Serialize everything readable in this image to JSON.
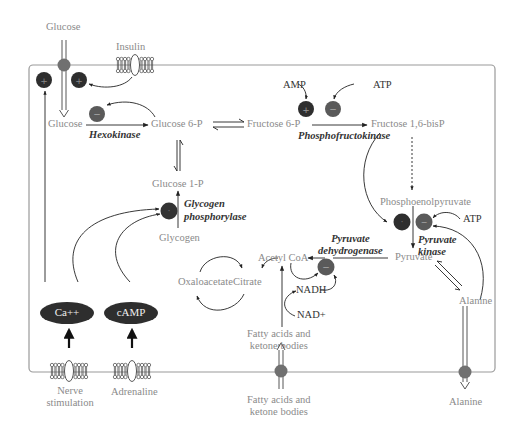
{
  "diagram": {
    "type": "metabolic-regulation-diagram",
    "colors": {
      "activator": "#3a3a3a",
      "inhibitor": "#5e5e5e",
      "transporter": "#707070",
      "line": "#333333",
      "cell_border": "#9a9a9a",
      "metabolite_text": "#8a8a8a",
      "label_text": "#333333"
    },
    "outside": {
      "glucose_top": "Glucose",
      "insulin": "Insulin",
      "nerve": "Nerve\nstimulation",
      "adrenaline": "Adrenaline",
      "fatty_bottom": "Fatty acids and\nketone bodies",
      "alanine_bottom": "Alanine"
    },
    "metabolites": {
      "glucose": "Glucose",
      "glucose6p": "Glucose 6-P",
      "fructose6p": "Fructose 6-P",
      "fructose16bp": "Fructose 1,6-bisP",
      "glucose1p": "Glucose 1-P",
      "glycogen": "Glycogen",
      "pep": "Phosphoenolpyruvate",
      "pyruvate": "Pyruvate",
      "alanine": "Alanine",
      "acetylcoa": "Acetyl CoA",
      "oxaloacetate": "Oxaloacetate",
      "citrate": "Citrate",
      "nadh": "NADH",
      "nad": "NAD+",
      "fatty_inside": "Fatty acids and\nketone bodies"
    },
    "effectors": {
      "amp": "AMP",
      "atp_pfk": "ATP",
      "atp_pk": "ATP"
    },
    "enzymes": {
      "hexokinase": "Hexokinase",
      "pfk": "Phosphofructokinase",
      "glycogen_phosphorylase": "Glycogen\nphosphorylase",
      "pdh": "Pyruvate\ndehydrogenase",
      "pk": "Pyruvate\nkinase"
    },
    "second_messengers": {
      "ca": "Ca++",
      "camp": "cAMP"
    },
    "symbols": {
      "plus": "+",
      "minus": "−"
    }
  }
}
